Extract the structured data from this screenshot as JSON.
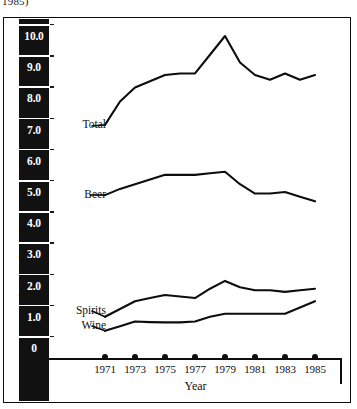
{
  "caption_fragment": "1985)",
  "axes": {
    "y_title": "Annual pure alcohol consumption per person 15+  (litres)",
    "x_title": "Year",
    "y_ticks": [
      "10.0",
      "9.0",
      "8.0",
      "7.0",
      "6.0",
      "5.0",
      "4.0",
      "3.0",
      "2.0",
      "1.0",
      "0"
    ],
    "x_ticks": [
      "1971",
      "1973",
      "1975",
      "1977",
      "1979",
      "1981",
      "1983",
      "1985"
    ]
  },
  "series_labels": {
    "total": "Total",
    "beer": "Beer",
    "spirits": "Spirits",
    "wine": "Wine"
  },
  "colors": {
    "line": "#0d0d0d",
    "band": "#111111",
    "tick_text": "#ffffff",
    "background": "#ffffff"
  },
  "chart_data": {
    "type": "line",
    "title": "",
    "xlabel": "Year",
    "ylabel": "Annual pure alcohol consumption per person 15+  (litres)",
    "x": [
      1971,
      1972,
      1973,
      1974,
      1975,
      1976,
      1977,
      1978,
      1979,
      1980,
      1981,
      1982,
      1983,
      1984,
      1985
    ],
    "xlim": [
      1971,
      1985
    ],
    "ylim": [
      0,
      10.5
    ],
    "yticks": [
      0,
      1,
      2,
      3,
      4,
      5,
      6,
      7,
      8,
      9,
      10
    ],
    "xticks": [
      1971,
      1973,
      1975,
      1977,
      1979,
      1981,
      1983,
      1985
    ],
    "grid": false,
    "legend": "inline-labels-left",
    "series": [
      {
        "name": "Total",
        "values": [
          7.15,
          7.9,
          8.35,
          8.55,
          8.75,
          8.8,
          8.8,
          9.4,
          10.0,
          9.15,
          8.75,
          8.6,
          8.8,
          8.6,
          8.75
        ]
      },
      {
        "name": "Beer",
        "values": [
          4.9,
          5.1,
          5.25,
          5.4,
          5.55,
          5.55,
          5.55,
          5.6,
          5.65,
          5.25,
          4.95,
          4.95,
          5.0,
          4.85,
          4.7
        ]
      },
      {
        "name": "Spirits",
        "values": [
          1.0,
          1.25,
          1.5,
          1.6,
          1.7,
          1.65,
          1.6,
          1.9,
          2.15,
          1.95,
          1.85,
          1.85,
          1.8,
          1.85,
          1.9
        ]
      },
      {
        "name": "Wine",
        "values": [
          0.55,
          0.7,
          0.85,
          0.83,
          0.82,
          0.82,
          0.85,
          1.0,
          1.1,
          1.1,
          1.1,
          1.1,
          1.1,
          1.3,
          1.5
        ]
      }
    ]
  }
}
